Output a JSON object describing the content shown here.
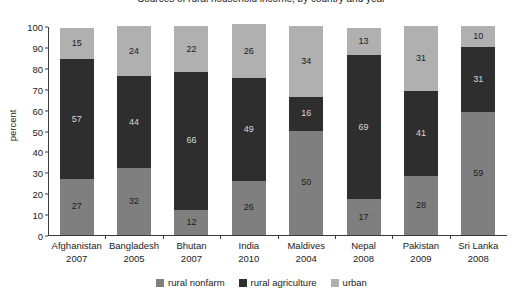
{
  "chart_data": {
    "type": "bar",
    "subtype": "stacked-bar-100",
    "title": "Sources of rural household income, by country and year",
    "xlabel": "",
    "ylabel": "percent",
    "ylim": [
      0,
      100
    ],
    "ytick_step": 10,
    "yticks": [
      0,
      10,
      20,
      30,
      40,
      50,
      60,
      70,
      80,
      90,
      100
    ],
    "grid": false,
    "legend_position": "bottom-center",
    "categories": [
      "Afghanistan",
      "Bangladesh",
      "Bhutan",
      "India",
      "Maldives",
      "Nepal",
      "Pakistan",
      "Sri Lanka"
    ],
    "category_years": [
      "2007",
      "2005",
      "2007",
      "2010",
      "2004",
      "2008",
      "2009",
      "2008"
    ],
    "series": [
      {
        "name": "rural nonfarm",
        "color": "#807f7f",
        "values": [
          27,
          32,
          12,
          26,
          50,
          17,
          28,
          59
        ]
      },
      {
        "name": "rural agriculture",
        "color": "#2e2e2e",
        "values": [
          57,
          44,
          66,
          49,
          16,
          69,
          41,
          31
        ]
      },
      {
        "name": "urban",
        "color": "#b0b0b0",
        "values": [
          15,
          24,
          22,
          26,
          34,
          13,
          31,
          10
        ]
      }
    ]
  }
}
